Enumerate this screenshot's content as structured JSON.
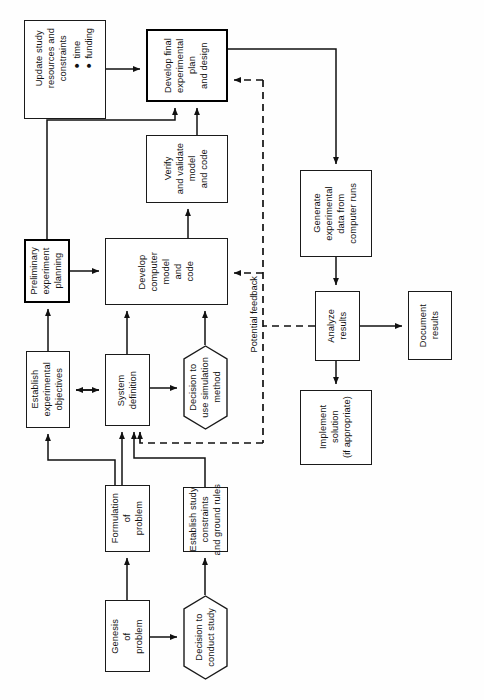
{
  "diagram": {
    "orientation": "rotated-90-ccw",
    "page_width": 484,
    "page_height": 700,
    "colors": {
      "background": "#fefefe",
      "stroke": "#1a1a1a",
      "emphasis_stroke": "#000000",
      "text": "#111111"
    }
  },
  "nodes": [
    {
      "id": "update-study",
      "shape": "box",
      "emphasis": false,
      "label": "Update study\nresources and\nconstraints",
      "bullets": "● time\n● funding",
      "x": 24,
      "y": 20,
      "w": 82,
      "h": 99
    },
    {
      "id": "develop-final-plan",
      "shape": "box",
      "emphasis": true,
      "label": "Develop final\nexperimental\nplan\nand design",
      "x": 146,
      "y": 29,
      "w": 82,
      "h": 73
    },
    {
      "id": "verify-validate",
      "shape": "box",
      "emphasis": false,
      "label": "Verify\nand validate\nmodel\nand code",
      "x": 146,
      "y": 135,
      "w": 82,
      "h": 68
    },
    {
      "id": "preliminary-planning",
      "shape": "box",
      "emphasis": true,
      "label": "Preliminary\nexperiment\nplanning",
      "x": 24,
      "y": 239,
      "w": 46,
      "h": 64
    },
    {
      "id": "develop-computer-model",
      "shape": "box",
      "emphasis": false,
      "label": "Develop\ncomputer\nmodel\nand\ncode",
      "x": 105,
      "y": 238,
      "w": 123,
      "h": 67
    },
    {
      "id": "establish-objectives",
      "shape": "box",
      "emphasis": false,
      "label": "Establish\nexperimental\nobjectives",
      "x": 26,
      "y": 351,
      "w": 44,
      "h": 77
    },
    {
      "id": "system-definition",
      "shape": "box",
      "emphasis": false,
      "label": "System\ndefinition",
      "x": 105,
      "y": 354,
      "w": 45,
      "h": 72
    },
    {
      "id": "decision-use-simulation",
      "shape": "hexagon",
      "emphasis": false,
      "label": "Decision to\nuse simulation\nmethod",
      "x": 183,
      "y": 345,
      "w": 45,
      "h": 85
    },
    {
      "id": "formulation-of-problem",
      "shape": "box",
      "emphasis": false,
      "label": "Formulation\nof\nproblem",
      "x": 105,
      "y": 485,
      "w": 45,
      "h": 67
    },
    {
      "id": "establish-study-constraints",
      "shape": "box",
      "emphasis": false,
      "label": "Establish study\nconstraints\nand ground rules",
      "x": 183,
      "y": 487,
      "w": 45,
      "h": 65
    },
    {
      "id": "genesis-of-problem",
      "shape": "box",
      "emphasis": false,
      "label": "Genesis\nof\nproblem",
      "x": 105,
      "y": 600,
      "w": 45,
      "h": 72
    },
    {
      "id": "decision-conduct-study",
      "shape": "hexagon",
      "emphasis": false,
      "label": "Decision to\nconduct study",
      "x": 183,
      "y": 595,
      "w": 45,
      "h": 85
    },
    {
      "id": "generate-experimental-data",
      "shape": "box",
      "emphasis": false,
      "label": "Generate\nexperimental\ndata from\ncomputer runs",
      "x": 300,
      "y": 170,
      "w": 72,
      "h": 87
    },
    {
      "id": "analyze-results",
      "shape": "box",
      "emphasis": false,
      "label": "Analyze\nresults",
      "x": 315,
      "y": 291,
      "w": 45,
      "h": 70
    },
    {
      "id": "document-results",
      "shape": "box",
      "emphasis": false,
      "label": "Document\nresults",
      "x": 408,
      "y": 291,
      "w": 44,
      "h": 69
    },
    {
      "id": "implement-solution",
      "shape": "box",
      "emphasis": false,
      "label": "Implement\nsolution\n(if appropriate)",
      "x": 300,
      "y": 390,
      "w": 72,
      "h": 75
    }
  ],
  "edge_labels": [
    {
      "id": "potential-feedback",
      "text": "Potential feedback",
      "x": 249,
      "y": 276
    }
  ],
  "edges": [
    {
      "from": "update-study",
      "to": "develop-final-plan",
      "style": "solid"
    },
    {
      "from": "develop-final-plan",
      "to": "generate-experimental-data",
      "style": "solid"
    },
    {
      "from": "verify-validate",
      "to": "develop-final-plan",
      "style": "solid"
    },
    {
      "from": "preliminary-planning",
      "to": "develop-final-plan",
      "style": "solid"
    },
    {
      "from": "preliminary-planning",
      "to": "develop-computer-model",
      "style": "solid"
    },
    {
      "from": "develop-computer-model",
      "to": "verify-validate",
      "style": "solid"
    },
    {
      "from": "establish-objectives",
      "to": "preliminary-planning",
      "style": "solid"
    },
    {
      "from": "establish-objectives",
      "to": "system-definition",
      "style": "solid-bidirectional"
    },
    {
      "from": "system-definition",
      "to": "develop-computer-model",
      "style": "solid"
    },
    {
      "from": "system-definition",
      "to": "decision-use-simulation",
      "style": "solid"
    },
    {
      "from": "decision-use-simulation",
      "to": "develop-computer-model",
      "style": "solid"
    },
    {
      "from": "formulation-of-problem",
      "to": "system-definition",
      "style": "solid"
    },
    {
      "from": "formulation-of-problem",
      "to": "establish-objectives",
      "style": "solid"
    },
    {
      "from": "establish-study-constraints",
      "to": "system-definition",
      "style": "solid"
    },
    {
      "from": "genesis-of-problem",
      "to": "formulation-of-problem",
      "style": "solid"
    },
    {
      "from": "genesis-of-problem",
      "to": "decision-conduct-study",
      "style": "solid"
    },
    {
      "from": "decision-conduct-study",
      "to": "establish-study-constraints",
      "style": "solid"
    },
    {
      "from": "generate-experimental-data",
      "to": "analyze-results",
      "style": "solid"
    },
    {
      "from": "analyze-results",
      "to": "document-results",
      "style": "solid"
    },
    {
      "from": "analyze-results",
      "to": "implement-solution",
      "style": "solid"
    },
    {
      "from": "analyze-results",
      "to": "develop-final-plan",
      "style": "dashed"
    },
    {
      "from": "analyze-results",
      "to": "develop-computer-model",
      "style": "dashed"
    },
    {
      "from": "analyze-results",
      "to": "system-definition",
      "style": "dashed"
    }
  ]
}
